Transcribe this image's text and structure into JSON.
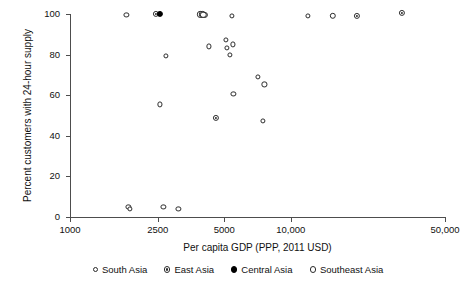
{
  "chart_data": {
    "type": "scatter",
    "title": "",
    "xlabel": "Per capita GDP (PPP, 2011 USD)",
    "ylabel": "Percent customers with 24-hour supply",
    "xscale": "log",
    "xlim": [
      1000,
      50000
    ],
    "ylim": [
      0,
      100
    ],
    "xticks": [
      1000,
      2500,
      5000,
      10000,
      50000
    ],
    "xtick_labels": [
      "1000",
      "2500",
      "5000",
      "10,000",
      "50,000"
    ],
    "yticks": [
      0,
      20,
      40,
      60,
      80,
      100
    ],
    "ytick_labels": [
      "0",
      "20",
      "40",
      "60",
      "80",
      "100"
    ],
    "grid": false,
    "legend_position": "bottom",
    "series": [
      {
        "name": "South Asia",
        "marker": "open-circle-small",
        "color": "#2b2b2b",
        "points": [
          {
            "x": 1800,
            "y": 99.5
          },
          {
            "x": 1840,
            "y": 5.0
          },
          {
            "x": 1870,
            "y": 3.8
          },
          {
            "x": 2650,
            "y": 4.8
          },
          {
            "x": 3100,
            "y": 4.0
          },
          {
            "x": 2560,
            "y": 55.5
          },
          {
            "x": 2720,
            "y": 79.3
          },
          {
            "x": 4250,
            "y": 84.0
          },
          {
            "x": 5400,
            "y": 99.0
          },
          {
            "x": 5500,
            "y": 60.5
          },
          {
            "x": 5100,
            "y": 87.3
          },
          {
            "x": 5150,
            "y": 83.2
          },
          {
            "x": 5300,
            "y": 79.8
          },
          {
            "x": 5450,
            "y": 85.0
          },
          {
            "x": 7100,
            "y": 69.0
          },
          {
            "x": 7600,
            "y": 65.3
          },
          {
            "x": 7500,
            "y": 47.5
          },
          {
            "x": 12000,
            "y": 99.0
          }
        ]
      },
      {
        "name": "East Asia",
        "marker": "dot-in-circle",
        "color": "#2b2b2b",
        "points": [
          {
            "x": 2460,
            "y": 100.0
          },
          {
            "x": 3900,
            "y": 99.8
          },
          {
            "x": 3980,
            "y": 99.8
          },
          {
            "x": 4080,
            "y": 99.5
          },
          {
            "x": 4600,
            "y": 49.0
          },
          {
            "x": 20000,
            "y": 99.0
          },
          {
            "x": 32000,
            "y": 100.5
          }
        ]
      },
      {
        "name": "Central Asia",
        "marker": "filled-circle",
        "color": "#000000",
        "points": [
          {
            "x": 2560,
            "y": 100.0
          }
        ]
      },
      {
        "name": "Southeast Asia",
        "marker": "open-circle-large",
        "color": "#2b2b2b",
        "points": [
          {
            "x": 4020,
            "y": 99.6
          },
          {
            "x": 15500,
            "y": 99.0
          }
        ]
      }
    ]
  },
  "legend": {
    "items": [
      {
        "label": "South Asia",
        "marker": "open-circle-small"
      },
      {
        "label": "East Asia",
        "marker": "dot-in-circle"
      },
      {
        "label": "Central Asia",
        "marker": "filled-circle"
      },
      {
        "label": "Southeast Asia",
        "marker": "open-circle-large"
      }
    ]
  }
}
